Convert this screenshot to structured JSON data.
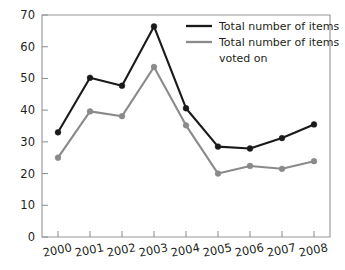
{
  "chart_data": {
    "type": "line",
    "title": "",
    "subtitle": "",
    "xlabel": "",
    "ylabel": "",
    "categories": [
      "2000",
      "2001",
      "2002",
      "2003",
      "2004",
      "2005",
      "2006",
      "2007",
      "2008"
    ],
    "x": [
      2000,
      2001,
      2002,
      2003,
      2004,
      2005,
      2006,
      2007,
      2008
    ],
    "series": [
      {
        "name": "Total number of items",
        "color": "#1a1a1a",
        "values": [
          33,
          50.2,
          47.7,
          66.4,
          40.6,
          28.5,
          27.9,
          31.2,
          35.5
        ]
      },
      {
        "name": "Total number of items voted on",
        "color": "#8a8a8a",
        "values": [
          25,
          39.6,
          38.1,
          53.6,
          35.2,
          20,
          22.4,
          21.5,
          23.9
        ]
      }
    ],
    "ylim": [
      0,
      70
    ],
    "yticks": [
      0,
      10,
      20,
      30,
      40,
      50,
      60,
      70
    ],
    "ytick_labels": [
      "0",
      "10",
      "20",
      "30",
      "40",
      "50",
      "60",
      "70"
    ],
    "xtick_labels": [
      "2000",
      "2001",
      "2002",
      "2003",
      "2004",
      "2005",
      "2006",
      "2007",
      "2008"
    ],
    "grid": false,
    "legend_position": "top-right",
    "legend_entries": [
      {
        "label": "Total number of items",
        "color": "#1a1a1a"
      },
      {
        "label": "Total number of items",
        "label2": "voted on",
        "color": "#8a8a8a"
      }
    ],
    "markers": "circle",
    "axis_color": "#939598",
    "background": "#ffffff"
  },
  "legend": {
    "entry_1_line_1": "Total number of items",
    "entry_2_line_1": "Total number of items",
    "entry_2_line_2": "voted on"
  }
}
